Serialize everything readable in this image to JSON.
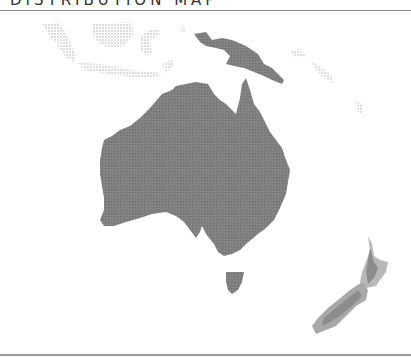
{
  "header": {
    "title": "DISTRIBUTION MAP"
  },
  "map": {
    "region": "Oceania",
    "colors": {
      "distribution": "#7a7a7a",
      "uncertain": "#b0b0b0",
      "context_land": "#e3e3e3"
    },
    "areas": [
      {
        "name": "Australia",
        "status": "present"
      },
      {
        "name": "Tasmania",
        "status": "present"
      },
      {
        "name": "New Guinea",
        "status": "present"
      },
      {
        "name": "New Zealand",
        "status": "partial"
      },
      {
        "name": "Indonesia",
        "status": "context"
      }
    ]
  }
}
